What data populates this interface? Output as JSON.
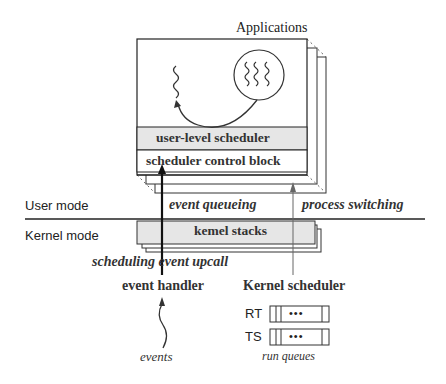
{
  "diagram": {
    "title": "Applications",
    "layers": {
      "user_level_scheduler": "user-level scheduler",
      "scheduler_control_block": "scheduler control block",
      "kernel_stacks": "kemel stacks"
    },
    "modes": {
      "user": "User mode",
      "kernel": "Kernel mode"
    },
    "flows": {
      "event_queueing": "event queueing",
      "process_switching": "process switching",
      "scheduling_event_upcall": "scheduling event upcall"
    },
    "components": {
      "event_handler": "event handler",
      "kernel_scheduler": "Kernel scheduler"
    },
    "inputs": {
      "events": "events"
    },
    "run_queues": {
      "label": "run queues",
      "queues": [
        {
          "name": "RT",
          "ellipsis": "•••"
        },
        {
          "name": "TS",
          "ellipsis": "•••"
        }
      ]
    },
    "colors": {
      "line": "#222222",
      "shade": "#e6e6e6",
      "thin_arrow": "#555555"
    }
  }
}
